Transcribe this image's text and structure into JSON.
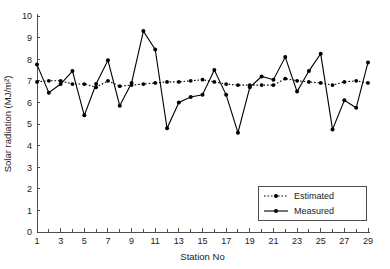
{
  "chart_data": {
    "type": "line",
    "title": "",
    "xlabel": "Station No",
    "ylabel": "Solar radiation (MJ/m²)",
    "xlim": [
      1,
      29
    ],
    "ylim": [
      0,
      10
    ],
    "yticks": [
      0,
      1,
      2,
      3,
      4,
      5,
      6,
      7,
      8,
      9,
      10
    ],
    "xticks": [
      1,
      3,
      5,
      7,
      9,
      11,
      13,
      15,
      17,
      19,
      21,
      23,
      25,
      27,
      29
    ],
    "xticks_minor": [
      2,
      4,
      6,
      8,
      10,
      12,
      14,
      16,
      18,
      20,
      22,
      24,
      26,
      28
    ],
    "grid": false,
    "legend_position": "lower right",
    "x": [
      1,
      2,
      3,
      4,
      5,
      6,
      7,
      8,
      9,
      10,
      11,
      12,
      13,
      14,
      15,
      16,
      17,
      18,
      19,
      20,
      21,
      22,
      23,
      24,
      25,
      26,
      27,
      28,
      29
    ],
    "series": [
      {
        "name": "Estimated",
        "style": "dotted",
        "marker": "circle",
        "values": [
          6.95,
          7.0,
          7.0,
          6.85,
          6.85,
          6.7,
          7.0,
          6.75,
          6.8,
          6.85,
          6.9,
          6.95,
          6.95,
          7.0,
          7.05,
          6.95,
          6.85,
          6.8,
          6.8,
          6.8,
          6.8,
          7.1,
          7.0,
          6.95,
          6.9,
          6.8,
          6.95,
          7.0,
          6.9
        ]
      },
      {
        "name": "Measured",
        "style": "solid",
        "marker": "circle",
        "values": [
          7.75,
          6.45,
          6.85,
          7.45,
          5.4,
          6.85,
          7.95,
          5.85,
          6.9,
          9.3,
          8.45,
          4.8,
          6.0,
          6.25,
          6.35,
          7.5,
          6.35,
          4.6,
          6.7,
          7.2,
          7.05,
          8.1,
          6.5,
          7.45,
          8.25,
          4.75,
          6.1,
          5.75,
          7.85
        ]
      }
    ],
    "colors": {
      "series": "#000000",
      "axis": "#4d4d4d",
      "background": "#ffffff"
    }
  },
  "legend": {
    "items": [
      {
        "label": "Estimated"
      },
      {
        "label": "Measured"
      }
    ]
  }
}
